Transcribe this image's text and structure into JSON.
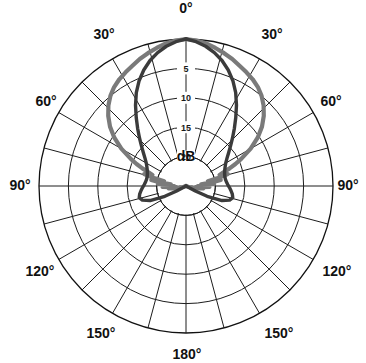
{
  "figure": {
    "kind": "polar-radiation-pattern",
    "unit_label": "dB",
    "background": "#ffffff"
  },
  "angular_axis": {
    "labels": [
      "0°",
      "30°",
      "30°",
      "60°",
      "60°",
      "90°",
      "90°",
      "120°",
      "120°",
      "150°",
      "150°",
      "180°"
    ],
    "label_0": "0°",
    "label_30_left": "30°",
    "label_30_right": "30°",
    "label_60_left": "60°",
    "label_60_right": "60°",
    "label_90_left": "90°",
    "label_90_right": "90°",
    "label_120_left": "120°",
    "label_120_right": "120°",
    "label_150_left": "150°",
    "label_150_right": "150°",
    "label_180": "180°",
    "tick_step_deg": 15,
    "labeled_step_deg": 30,
    "range_deg": [
      -180,
      180
    ]
  },
  "radial_axis": {
    "tick_labels": [
      "5",
      "10",
      "15",
      "20"
    ],
    "tick_values_db": [
      5,
      10,
      15,
      20
    ],
    "unit": "dB",
    "outer_value_db": 0,
    "center_value_db": 25,
    "direction": "inward-decreasing",
    "num_rings": 5
  },
  "chart_data": {
    "type": "line",
    "coordinate_system": "polar",
    "title": "",
    "xlabel": "",
    "ylabel": "dB",
    "rlim": [
      25,
      0
    ],
    "rlabel_ticks": [
      5,
      10,
      15,
      20
    ],
    "grid": true,
    "legend": "none",
    "theta_unit": "degrees",
    "series": [
      {
        "name": "broad-pattern",
        "color": "#7a7a7a",
        "linewidth": 4.2,
        "theta": [
          0,
          4,
          8,
          12,
          16,
          20,
          24,
          28,
          32,
          36,
          40,
          44,
          48,
          52,
          56,
          60,
          64,
          66,
          68,
          70,
          72,
          74,
          76,
          78,
          80,
          82,
          84,
          86,
          88,
          90,
          92,
          94,
          96,
          98,
          100,
          102,
          104,
          106,
          108,
          110
        ],
        "r_db": [
          0.0,
          0.2,
          0.5,
          1.0,
          1.5,
          2.0,
          2.6,
          3.1,
          3.6,
          4.2,
          5.0,
          6.0,
          7.2,
          8.6,
          10.3,
          12.3,
          14.6,
          15.8,
          17.0,
          18.2,
          19.0,
          17.6,
          19.4,
          21.2,
          19.0,
          20.6,
          22.4,
          20.2,
          21.6,
          23.0,
          21.0,
          22.2,
          23.4,
          22.0,
          23.0,
          24.0,
          23.2,
          24.0,
          24.6,
          25.0
        ]
      },
      {
        "name": "narrow-pattern",
        "color": "#3b3b3b",
        "linewidth": 3.4,
        "theta": [
          0,
          4,
          8,
          12,
          16,
          20,
          24,
          28,
          32,
          36,
          40,
          44,
          48,
          52,
          56,
          60,
          64,
          68,
          72,
          76,
          80,
          84,
          88,
          92,
          96,
          100,
          104,
          108,
          112,
          116,
          118,
          120
        ],
        "r_db": [
          0.0,
          0.4,
          1.0,
          1.8,
          2.8,
          4.0,
          5.4,
          7.0,
          8.8,
          10.6,
          12.2,
          13.6,
          14.8,
          15.8,
          16.6,
          17.2,
          17.6,
          17.9,
          18.1,
          18.2,
          18.2,
          18.1,
          17.9,
          17.6,
          17.3,
          17.0,
          16.8,
          17.2,
          18.4,
          21.0,
          23.2,
          25.0
        ]
      }
    ]
  }
}
